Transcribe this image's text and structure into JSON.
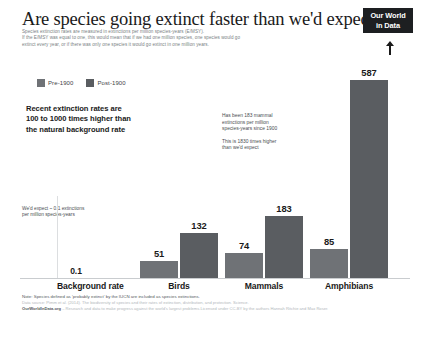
{
  "header": {
    "title": "Are species going extinct faster than we'd expect?",
    "subtitle_lines": [
      "Species extinction rates are measured in extinctions per million species-years (E/MSY).",
      "If the E/MSY was equal to one, this would mean that if we had one million species, one species would go",
      "extinct every year, or if there was only one species it would go extinct in one million years."
    ],
    "logo_line1": "Our World",
    "logo_line2": "in Data"
  },
  "legend": {
    "items": [
      {
        "label": "Pre-1900",
        "color": "#6f7276"
      },
      {
        "label": "Post-1900",
        "color": "#5a5d61"
      }
    ]
  },
  "statement_lines": [
    "Recent extinction rates are",
    "100 to 1000 times higher than",
    "the natural background rate"
  ],
  "annotations": {
    "background_note_lines": [
      "We'd expect ~ 0.1 extinctions",
      "per million species-years"
    ],
    "mammal_note_block1": [
      "Has been 183 mammal",
      "extinctions per million",
      "species-years since 1900"
    ],
    "mammal_note_block2": [
      "This is 1830 times higher",
      "than we'd expect"
    ]
  },
  "footer": {
    "note": "Note: Species defined as 'probably extinct' by the IUCN are included as species extinctions.",
    "source": "Data source: Pimm et al. (2014). The biodiversity of species and their rates of extinction, distribution, and protection. Science.",
    "owid_brand": "OurWorldInData.org",
    "owid_rest": " – Research and data to make progress against the world's largest problems.",
    "license": "Licensed under CC-BY by the authors Hannah Ritchie and Max Roser."
  },
  "chart_data": {
    "type": "bar",
    "title": "Are species going extinct faster than we'd expect?",
    "xlabel": "",
    "ylabel": "Extinctions per million species-years (E/MSY)",
    "categories": [
      "Background rate",
      "Birds",
      "Mammals",
      "Amphibians"
    ],
    "series": [
      {
        "name": "Pre-1900",
        "values": [
          0.1,
          51,
          74,
          85
        ]
      },
      {
        "name": "Post-1900",
        "values": [
          null,
          132,
          183,
          587
        ]
      }
    ],
    "ylim": [
      0,
      587
    ],
    "grid": false,
    "legend_position": "top-left",
    "bars": [
      {
        "category": "Background rate",
        "series": "Pre-1900",
        "value": 0.1,
        "label": "0.1"
      },
      {
        "category": "Birds",
        "series": "Pre-1900",
        "value": 51,
        "label": "51"
      },
      {
        "category": "Birds",
        "series": "Post-1900",
        "value": 132,
        "label": "132"
      },
      {
        "category": "Mammals",
        "series": "Pre-1900",
        "value": 74,
        "label": "74"
      },
      {
        "category": "Mammals",
        "series": "Post-1900",
        "value": 183,
        "label": "183"
      },
      {
        "category": "Amphibians",
        "series": "Pre-1900",
        "value": 85,
        "label": "85"
      },
      {
        "category": "Amphibians",
        "series": "Post-1900",
        "value": 587,
        "label": "587"
      }
    ]
  }
}
